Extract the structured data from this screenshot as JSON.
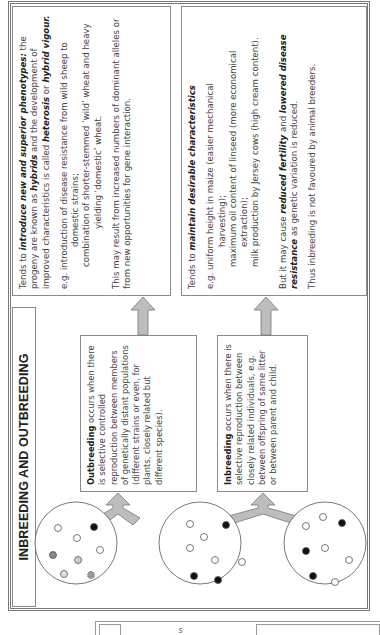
{
  "page": {
    "title": "INBREEDING AND OUTBREEDING",
    "orientation": "rotated 90° counter-clockwise"
  },
  "outbreeding": {
    "term": "Outbreeding",
    "definition": " occurs when there is selective controlled reproduction between members of genetically distant populations (different strains or even, for plants, closely related but different species)."
  },
  "inbreeding": {
    "term": "Inbreeding",
    "definition": " occurs when there is selective reproduction between closely related individuals, e.g. between offspring of same litter or between parent and child."
  },
  "outbreeding_effects": {
    "intro_prefix": "Tends to ",
    "intro_emph": "introduce new and superior phenotypes:",
    "intro_mid1": " the progeny are known as ",
    "hybrids": "hybrids",
    "intro_mid2": " and the development of improved characteristics is called ",
    "heterosis": "heterosis",
    "or": " or ",
    "hybrid_vigour": "hybrid vigour.",
    "example_line1": "e.g. introduction of disease resistance from wild sheep to",
    "example_line2": "domestic strains;",
    "example_line3": "combination of shorter-stemmed ‘wild’ wheat and heavy",
    "example_line4": "yielding ‘domestic’ wheat.",
    "note": "This may result from increased numbers of dominant alleles or from new opportunities for gene interaction."
  },
  "inbreeding_effects": {
    "intro_prefix": "Tends to ",
    "intro_emph": "maintain desirable characteristics",
    "example_line1": "e.g. uniform height in maize (easier mechanical",
    "example_line2": "harvesting);",
    "example_line3": "maximum oil content of linseed (more economical",
    "example_line4": "extraction);",
    "example_line5": "milk production by Jersey cows (high cream content).",
    "caveat_prefix": "But it may cause ",
    "reduced_fertility": "reduced fertility",
    "and": " and ",
    "lowered_resistance": "lowered disease resistance",
    "caveat_suffix": " as genetic variation is reduced.",
    "conclusion": "Thus inbreeding is not favoured by animal breeders."
  },
  "populations": [
    {
      "name": "population-varied",
      "dots": [
        "white",
        "white",
        "black",
        "grey-dark",
        "grey-light",
        "white",
        "grey-light",
        "hatched"
      ]
    },
    {
      "name": "population-mixed",
      "dots": [
        "white",
        "white",
        "black",
        "white",
        "white",
        "white",
        "black",
        "black"
      ]
    },
    {
      "name": "population-related",
      "dots": [
        "white",
        "white",
        "black",
        "black",
        "white",
        "white",
        "black",
        "white"
      ]
    }
  ],
  "fragment": {
    "glyph": "s"
  },
  "colors": {
    "arrow_fill": "#bdbdbd",
    "arrow_stroke": "#777777",
    "border": "#888888",
    "text": "#444444"
  }
}
